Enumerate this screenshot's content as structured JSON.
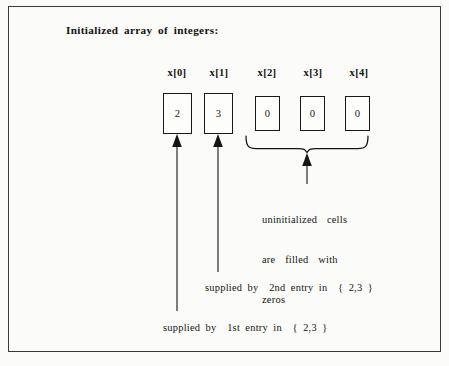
{
  "diagram": {
    "title": "Initialized array of integers:",
    "cells": [
      {
        "label": "x[0]",
        "value": "2"
      },
      {
        "label": "x[1]",
        "value": "3"
      },
      {
        "label": "x[2]",
        "value": "0"
      },
      {
        "label": "x[3]",
        "value": "0"
      },
      {
        "label": "x[4]",
        "value": "0"
      }
    ],
    "annotations": {
      "uninitialized_line1": "uninitialized  cells",
      "uninitialized_line2": "are  filled  with",
      "uninitialized_line3": "zeros",
      "caption_second": "supplied by  2nd entry in  { 2,3 }",
      "caption_first": "supplied by  1st entry in  { 2,3 }"
    },
    "colors": {
      "ink": "#141414",
      "frame": "#3a3a3a",
      "paper": "#fbfbf9",
      "cell_border": "#181818"
    }
  }
}
